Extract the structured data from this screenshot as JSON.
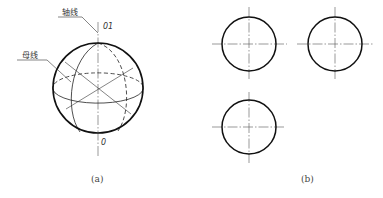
{
  "figure_a": {
    "caption": "(a)",
    "labels": {
      "axis_line": "轴线",
      "generatrix": "母线",
      "top_point": "01",
      "bottom_point": "0"
    },
    "sphere": {
      "cx": 98,
      "cy": 88,
      "r": 45
    }
  },
  "figure_b": {
    "caption": "(b)",
    "views": [
      {
        "name": "front-view",
        "cx": 249,
        "cy": 44,
        "r": 27
      },
      {
        "name": "side-view",
        "cx": 335,
        "cy": 44,
        "r": 27
      },
      {
        "name": "top-view",
        "cx": 249,
        "cy": 127,
        "r": 27
      }
    ]
  },
  "colors": {
    "line": "#222222",
    "centerline": "#555555",
    "background": "#ffffff"
  }
}
